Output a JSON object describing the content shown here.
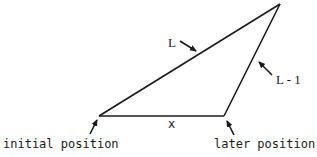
{
  "diagram": {
    "stroke_color": "#1a1a1a",
    "vertices": {
      "initial": {
        "x": 99,
        "y": 116
      },
      "later": {
        "x": 224,
        "y": 116
      },
      "apex": {
        "x": 280,
        "y": 4
      }
    },
    "labels": {
      "hypotenuse": "L",
      "right_side": "L - 1",
      "base": "x",
      "initial_position": "initial position",
      "later_position": "later position"
    }
  }
}
